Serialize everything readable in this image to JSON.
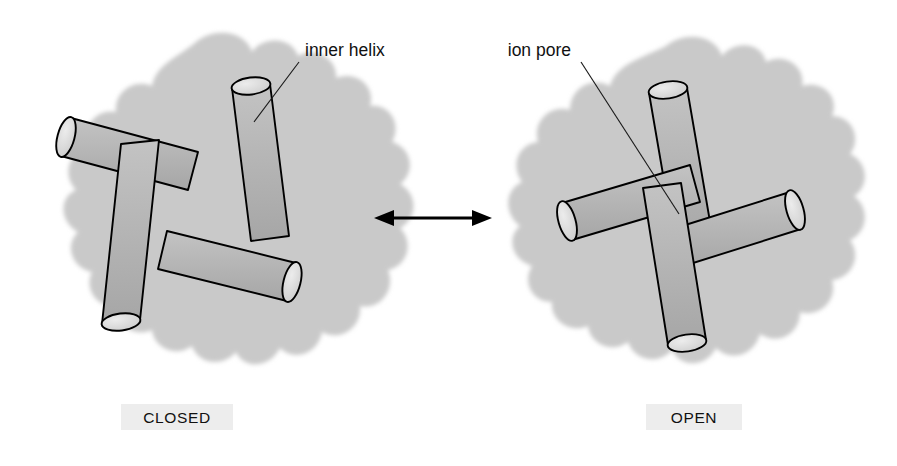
{
  "figure": {
    "background_color": "#ffffff",
    "width": 897,
    "height": 466
  },
  "colors": {
    "protein_blob": "#c9c9c9",
    "cylinder_body": "#b6b6b6",
    "cylinder_body_shade": "#a9a9a9",
    "cylinder_cap": "#dedede",
    "outline": "#000000",
    "pore_fill": "#ffffff",
    "caption_patch": "#ededed",
    "text": "#111111"
  },
  "panels": [
    {
      "id": "closed",
      "state_label": "CLOSED",
      "caption_position": "bottom-center",
      "annotation": {
        "label": "inner helix",
        "target": "inner helix cylinder body",
        "leader": "diagonal line from label down-left to helix surface"
      },
      "pore": {
        "present": false,
        "description": "inner helices converge; no central opening"
      },
      "helix_count": 4,
      "arrangement": "pinwheel"
    },
    {
      "id": "open",
      "state_label": "OPEN",
      "caption_position": "bottom-center",
      "annotation": {
        "label": "ion pore",
        "target": "central white circular opening",
        "leader": "diagonal line from label down-right into pore centre"
      },
      "pore": {
        "present": true,
        "shape": "circle",
        "fill": "#ffffff",
        "description": "inner helices splay outward opening a central ion-conducting pore"
      },
      "helix_count": 4,
      "arrangement": "pinwheel"
    }
  ],
  "transition": {
    "icon": "double-headed-arrow",
    "direction": "bidirectional",
    "meaning": "reversible gating between closed and open states"
  }
}
